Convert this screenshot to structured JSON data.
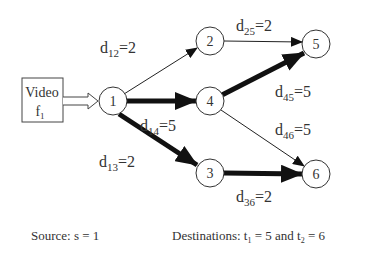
{
  "source_box": {
    "line1": "Video",
    "line2": "f",
    "line2_sub": "1"
  },
  "nodes": [
    {
      "id": "1",
      "label": "1",
      "x": 113,
      "y": 101
    },
    {
      "id": "2",
      "label": "2",
      "x": 210,
      "y": 41
    },
    {
      "id": "3",
      "label": "3",
      "x": 210,
      "y": 173
    },
    {
      "id": "4",
      "label": "4",
      "x": 210,
      "y": 101
    },
    {
      "id": "5",
      "label": "5",
      "x": 316,
      "y": 44
    },
    {
      "id": "6",
      "label": "6",
      "x": 316,
      "y": 174
    }
  ],
  "edges": [
    {
      "from": "1",
      "to": "2",
      "label": "d",
      "sub": "12",
      "value": "=2",
      "thick": false
    },
    {
      "from": "1",
      "to": "4",
      "label": "d",
      "sub": "14",
      "value": "=5",
      "thick": true
    },
    {
      "from": "1",
      "to": "3",
      "label": "d",
      "sub": "13",
      "value": "=2",
      "thick": true
    },
    {
      "from": "2",
      "to": "5",
      "label": "d",
      "sub": "25",
      "value": "=2",
      "thick": false
    },
    {
      "from": "4",
      "to": "5",
      "label": "d",
      "sub": "45",
      "value": "=5",
      "thick": true
    },
    {
      "from": "4",
      "to": "6",
      "label": "d",
      "sub": "46",
      "value": "=5",
      "thick": false
    },
    {
      "from": "3",
      "to": "6",
      "label": "d",
      "sub": "36",
      "value": "=2",
      "thick": true
    }
  ],
  "footer": {
    "source_text": "Source: s = 1",
    "dest_prefix": "Destinations: t",
    "t1_sub": "1",
    "t1_val": " = 5 and t",
    "t2_sub": "2",
    "t2_val": " = 6"
  },
  "colors": {
    "stroke": "#222222",
    "text": "#333333"
  }
}
